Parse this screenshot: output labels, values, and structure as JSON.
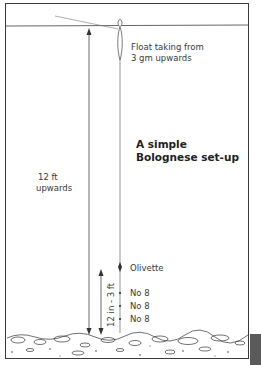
{
  "diagram": {
    "title_line1": "A simple",
    "title_line2": "Bolognese set-up",
    "float_label_line1": "Float taking from",
    "float_label_line2": "3 gm upwards",
    "depth_label_line1": "12 ft",
    "depth_label_line2": "upwards",
    "tail_length_label": "12 in - 3 ft",
    "weights": [
      {
        "label": "Olivette"
      },
      {
        "label": "No 8"
      },
      {
        "label": "No 8"
      },
      {
        "label": "No 8"
      }
    ],
    "colors": {
      "ink": "#3a3a3a",
      "background": "#ffffff"
    }
  }
}
